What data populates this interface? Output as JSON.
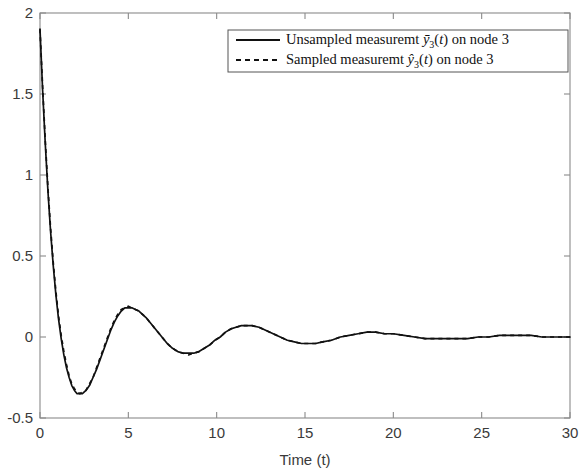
{
  "chart_data": {
    "type": "line",
    "title": "",
    "xlabel": "Time (t)",
    "ylabel": "",
    "xlim": [
      0,
      30
    ],
    "ylim": [
      -0.5,
      2
    ],
    "xticks": [
      "0",
      "5",
      "10",
      "15",
      "20",
      "25",
      "30"
    ],
    "yticks": [
      "-0.5",
      "0",
      "0.5",
      "1",
      "1.5",
      "2"
    ],
    "grid": false,
    "legend_position": "top-right",
    "legend": [
      {
        "label_prefix": "Unsampled measuremt ",
        "symbol_base": "y",
        "symbol_accent": "bar",
        "symbol_sub": "3",
        "symbol_arg": "(t)",
        "label_suffix": " on node 3",
        "style": "solid",
        "color": "#111111"
      },
      {
        "label_prefix": "Sampled measuremt ",
        "symbol_base": "y",
        "symbol_accent": "hat",
        "symbol_sub": "3",
        "symbol_arg": "(t)",
        "label_suffix": " on node 3",
        "style": "dashed",
        "color": "#111111"
      }
    ],
    "series": [
      {
        "name": "Unsampled measuremt ybar_3(t) on node 3",
        "style": "solid",
        "x": [
          0,
          0.15,
          0.3,
          0.45,
          0.6,
          0.75,
          0.9,
          1.05,
          1.2,
          1.35,
          1.5,
          1.65,
          1.8,
          1.95,
          2.1,
          2.25,
          2.4,
          2.6,
          2.8,
          3.0,
          3.2,
          3.4,
          3.6,
          3.8,
          4.0,
          4.2,
          4.4,
          4.6,
          4.8,
          5.0,
          5.2,
          5.4,
          5.6,
          5.8,
          6.0,
          6.3,
          6.6,
          6.9,
          7.2,
          7.5,
          7.8,
          8.1,
          8.4,
          8.7,
          9.0,
          9.3,
          9.6,
          9.9,
          10.2,
          10.5,
          10.8,
          11.1,
          11.4,
          11.7,
          12.0,
          12.4,
          12.8,
          13.2,
          13.6,
          14.0,
          14.4,
          14.8,
          15.2,
          15.6,
          16.0,
          16.5,
          17.0,
          17.5,
          18.0,
          18.5,
          19.0,
          19.5,
          20.0,
          20.6,
          21.2,
          21.8,
          22.4,
          23.0,
          23.6,
          24.2,
          24.8,
          25.4,
          26.0,
          26.6,
          27.2,
          27.8,
          28.4,
          29.0,
          29.5,
          30.0
        ],
        "y": [
          1.9,
          1.52,
          1.19,
          0.9,
          0.65,
          0.44,
          0.26,
          0.11,
          -0.01,
          -0.11,
          -0.19,
          -0.25,
          -0.3,
          -0.33,
          -0.35,
          -0.35,
          -0.35,
          -0.33,
          -0.3,
          -0.25,
          -0.2,
          -0.14,
          -0.08,
          -0.02,
          0.04,
          0.09,
          0.13,
          0.16,
          0.18,
          0.18,
          0.18,
          0.17,
          0.16,
          0.14,
          0.12,
          0.08,
          0.04,
          0.0,
          -0.04,
          -0.07,
          -0.09,
          -0.1,
          -0.1,
          -0.1,
          -0.09,
          -0.07,
          -0.05,
          -0.02,
          0.0,
          0.03,
          0.05,
          0.06,
          0.07,
          0.07,
          0.07,
          0.06,
          0.04,
          0.02,
          0.0,
          -0.02,
          -0.03,
          -0.04,
          -0.04,
          -0.04,
          -0.03,
          -0.02,
          0.0,
          0.01,
          0.02,
          0.03,
          0.03,
          0.02,
          0.02,
          0.01,
          0.0,
          -0.01,
          -0.01,
          -0.01,
          -0.01,
          -0.01,
          0.0,
          0.0,
          0.01,
          0.01,
          0.01,
          0.01,
          0.0,
          0.0,
          0.0,
          0.0
        ]
      },
      {
        "name": "Sampled measuremt yhat_3(t) on node 3",
        "style": "dashed",
        "x": [
          0,
          0.15,
          0.3,
          0.45,
          0.6,
          0.75,
          0.9,
          1.05,
          1.2,
          1.35,
          1.5,
          1.65,
          1.8,
          1.95,
          2.1,
          2.25,
          2.4,
          2.6,
          2.8,
          3.0,
          3.2,
          3.4,
          3.6,
          3.8,
          4.0,
          4.2,
          4.4,
          4.6,
          4.8,
          5.0,
          5.2,
          5.4,
          5.6,
          5.8,
          6.0,
          6.3,
          6.6,
          6.9,
          7.2,
          7.5,
          7.8,
          8.1,
          8.4,
          8.7,
          9.0,
          9.3,
          9.6,
          9.9,
          10.2,
          10.5,
          10.8,
          11.1,
          11.4,
          11.7,
          12.0,
          12.4,
          12.8,
          13.2,
          13.6,
          14.0,
          14.4,
          14.8,
          15.2,
          15.6,
          16.0,
          16.5,
          17.0,
          17.5,
          18.0,
          18.5,
          19.0,
          19.5,
          20.0,
          20.6,
          21.2,
          21.8,
          22.4,
          23.0,
          23.6,
          24.2,
          24.8,
          25.4,
          26.0,
          26.6,
          27.2,
          27.8,
          28.4,
          29.0,
          29.5,
          30.0
        ],
        "y": [
          1.9,
          1.54,
          1.21,
          0.92,
          0.67,
          0.46,
          0.28,
          0.13,
          0.01,
          -0.09,
          -0.17,
          -0.24,
          -0.29,
          -0.32,
          -0.34,
          -0.35,
          -0.34,
          -0.33,
          -0.29,
          -0.25,
          -0.19,
          -0.13,
          -0.07,
          -0.01,
          0.05,
          0.1,
          0.14,
          0.17,
          0.18,
          0.19,
          0.18,
          0.17,
          0.16,
          0.14,
          0.12,
          0.08,
          0.04,
          0.0,
          -0.04,
          -0.07,
          -0.09,
          -0.1,
          -0.11,
          -0.1,
          -0.09,
          -0.07,
          -0.05,
          -0.02,
          0.0,
          0.03,
          0.05,
          0.06,
          0.07,
          0.07,
          0.07,
          0.06,
          0.04,
          0.02,
          0.0,
          -0.02,
          -0.03,
          -0.04,
          -0.04,
          -0.04,
          -0.03,
          -0.02,
          0.0,
          0.01,
          0.02,
          0.03,
          0.03,
          0.02,
          0.02,
          0.01,
          0.0,
          -0.01,
          -0.01,
          -0.01,
          -0.01,
          -0.01,
          0.0,
          0.0,
          0.01,
          0.01,
          0.01,
          0.01,
          0.0,
          0.0,
          0.0,
          0.0
        ]
      }
    ]
  },
  "axes": {
    "x_title": "Time (t)"
  },
  "colors": {
    "curve": "#111111",
    "frame": "#8a8a8a",
    "tick_label": "#3a3a3a",
    "background": "#ffffff"
  }
}
